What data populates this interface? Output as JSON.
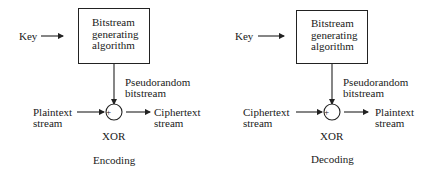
{
  "encoding": {
    "key_label": "Key",
    "box_lines": [
      "Bitstream",
      "generating",
      "algorithm"
    ],
    "bitstream_label_lines": [
      "Pseudorandom",
      "bitstream"
    ],
    "input_lines": [
      "Plaintext",
      "stream"
    ],
    "output_lines": [
      "Ciphertext",
      "stream"
    ],
    "xor_label": "XOR",
    "xor_symbol": "+",
    "caption": "Encoding"
  },
  "decoding": {
    "key_label": "Key",
    "box_lines": [
      "Bitstream",
      "generating",
      "algorithm"
    ],
    "bitstream_label_lines": [
      "Pseudorandom",
      "bitstream"
    ],
    "input_lines": [
      "Ciphertext",
      "stream"
    ],
    "output_lines": [
      "Plaintext",
      "stream"
    ],
    "xor_label": "XOR",
    "xor_symbol": "+",
    "caption": "Decoding"
  }
}
